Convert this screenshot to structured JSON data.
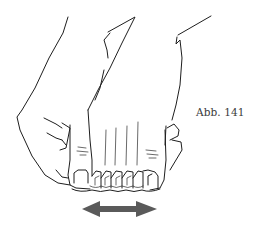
{
  "figure": {
    "caption": "Abb. 141",
    "arrow": {
      "type": "double-headed-horizontal",
      "color": "#5a5a5a"
    },
    "line_color": "#1e1e1e",
    "background": "#ffffff"
  }
}
